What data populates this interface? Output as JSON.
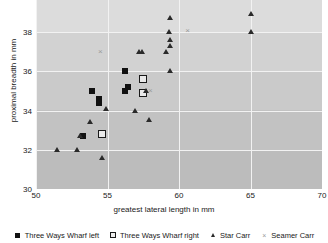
{
  "chart_data": {
    "type": "scatter",
    "title": "",
    "xlabel": "greatest lateral length in mm",
    "ylabel": "proximal breadth in mm",
    "xlim": [
      50,
      70
    ],
    "ylim": [
      30,
      38.9
    ],
    "xticks": [
      50,
      55,
      60,
      65,
      70
    ],
    "yticks": [
      30,
      32,
      34,
      36,
      38
    ],
    "grid": true,
    "legend_position": "bottom",
    "series": [
      {
        "name": "Three Ways Wharf left",
        "marker": "filled-square",
        "color": "#111111",
        "points": [
          [
            53.3,
            32.7
          ],
          [
            53.9,
            35.0
          ],
          [
            54.4,
            34.6
          ],
          [
            54.4,
            34.4
          ],
          [
            56.2,
            36.0
          ],
          [
            56.2,
            35.0
          ],
          [
            56.4,
            35.2
          ]
        ]
      },
      {
        "name": "Three Ways Wharf right",
        "marker": "open-square",
        "color": "#1a1a1a",
        "points": [
          [
            54.6,
            32.8
          ],
          [
            57.5,
            35.6
          ],
          [
            57.5,
            34.9
          ]
        ]
      },
      {
        "name": "Star Carr",
        "marker": "triangle",
        "color": "#2a2a2a",
        "points": [
          [
            51.5,
            32.0
          ],
          [
            52.9,
            32.0
          ],
          [
            53.1,
            32.7
          ],
          [
            53.8,
            33.4
          ],
          [
            54.9,
            34.1
          ],
          [
            54.6,
            31.6
          ],
          [
            56.9,
            34.0
          ],
          [
            57.9,
            33.5
          ],
          [
            57.2,
            37.0
          ],
          [
            57.4,
            37.0
          ],
          [
            57.7,
            35.0
          ],
          [
            59.3,
            38.0
          ],
          [
            59.4,
            37.6
          ],
          [
            59.4,
            37.3
          ],
          [
            59.1,
            37.0
          ],
          [
            59.4,
            38.7
          ],
          [
            59.4,
            36.0
          ],
          [
            65.0,
            38.0
          ],
          [
            65.0,
            38.9
          ]
        ]
      },
      {
        "name": "Seamer Carr",
        "marker": "x-cross",
        "color": "#9a9a9a",
        "points": [
          [
            54.5,
            37.0
          ],
          [
            58.0,
            35.0
          ],
          [
            60.6,
            38.1
          ]
        ]
      }
    ]
  },
  "legend": {
    "items": [
      {
        "label": "Three Ways Wharf left",
        "key": "filled-square-key"
      },
      {
        "label": "Three Ways Wharf right",
        "key": "open-square-key"
      },
      {
        "label": "Star Carr",
        "key": "triangle-key"
      },
      {
        "label": "Seamer Carr",
        "key": "x-cross-key"
      }
    ]
  },
  "axes": {
    "x_tick_labels": [
      "50",
      "55",
      "60",
      "65",
      "70"
    ],
    "y_tick_labels": [
      "30",
      "32",
      "34",
      "36",
      "38"
    ],
    "x_title": "greatest lateral length in mm",
    "y_title": "proximal breadth in mm"
  }
}
